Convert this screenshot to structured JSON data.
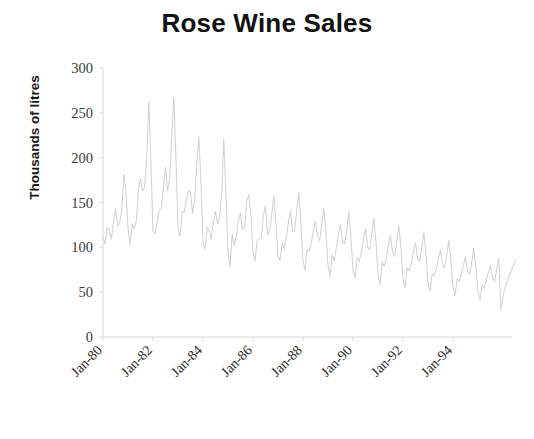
{
  "chart_data": {
    "type": "line",
    "title": "Rose Wine Sales",
    "xlabel": "",
    "ylabel": "Thousands of litres",
    "ylim": [
      0,
      300
    ],
    "y_ticks": [
      0,
      50,
      100,
      150,
      200,
      250,
      300
    ],
    "y_tick_labels": [
      "0",
      "50",
      "100",
      "150",
      "200",
      "250",
      "300"
    ],
    "x_tick_labels": [
      "Jan-80",
      "Jan-82",
      "Jan-84",
      "Jan-86",
      "Jan-88",
      "Jan-90",
      "Jan-92",
      "Jan-94"
    ],
    "x_tick_indices": [
      0,
      24,
      48,
      72,
      96,
      120,
      144,
      168
    ],
    "x_start_label": "Jan-80",
    "x_end_label": "Jul-95",
    "grid": false,
    "legend": "none",
    "series": [
      {
        "name": "Rose Wine Sales",
        "color": "#d2d2d2",
        "units": "thousands of litres",
        "frequency": "monthly",
        "values": [
          112,
          118,
          132,
          129,
          121,
          135,
          148,
          148,
          136,
          119,
          104,
          118,
          115,
          126,
          141,
          135,
          125,
          149,
          170,
          170,
          158,
          133,
          114,
          140,
          145,
          150,
          178,
          163,
          172,
          178,
          199,
          199,
          184,
          162,
          146,
          166,
          171,
          180,
          193,
          181,
          183,
          218,
          230,
          242,
          209,
          191,
          172,
          194,
          196,
          196,
          236,
          235,
          229,
          243,
          264,
          272,
          237,
          211,
          180,
          201,
          204,
          188,
          235,
          227,
          234,
          264,
          302,
          293,
          259,
          229,
          203,
          229,
          242,
          233,
          267,
          269,
          270,
          315,
          364,
          347,
          312,
          274,
          237,
          278,
          284,
          277,
          317,
          313,
          318,
          374,
          413,
          405,
          355,
          306,
          271,
          306,
          315,
          301,
          356,
          348,
          355,
          422,
          465,
          467,
          404,
          347,
          305,
          336,
          340,
          318,
          362,
          348,
          363,
          435,
          491,
          505,
          404,
          359,
          310,
          337,
          360,
          342,
          406,
          396,
          420,
          472,
          548,
          559,
          463,
          407,
          362,
          405,
          417,
          391,
          419,
          461,
          472,
          535,
          622,
          606,
          508,
          461,
          390,
          432
        ]
      }
    ],
    "data_points_monthly": {
      "start": "Jan-1980",
      "end": "Jul-1995",
      "n": 187,
      "values": [
        112,
        118,
        132,
        129,
        121,
        135,
        148,
        148,
        136,
        119,
        104,
        118,
        115,
        126,
        141,
        135,
        125,
        149,
        170,
        170,
        158,
        133,
        114,
        140,
        145,
        150,
        178,
        163,
        172,
        178,
        199,
        199,
        184,
        162,
        146,
        166,
        171,
        180,
        193,
        181,
        183,
        218,
        230,
        242,
        209,
        191,
        172,
        194,
        196,
        196,
        236,
        235,
        229,
        243,
        264,
        272,
        237,
        211,
        180,
        201
      ]
    },
    "series_values": [
      111.2,
      104.1,
      122.0,
      119.0,
      109.2,
      126.7,
      142.6,
      124.0,
      127.7,
      140.5,
      181.5,
      163.8,
      121.1,
      103.0,
      126.1,
      120.8,
      129.4,
      164.6,
      176.2,
      163.0,
      166.8,
      201.1,
      262.9,
      197.2,
      117.8,
      115.2,
      127.8,
      141.0,
      143.9,
      166.7,
      189.4,
      163.1,
      175.7,
      223.8,
      267.7,
      201.4,
      120.1,
      112.3,
      140.0,
      139.0,
      152.8,
      163.1,
      161.6,
      137.8,
      153.0,
      193.1,
      224.0,
      174.0,
      104.0,
      98.0,
      122.0,
      119.0,
      109.0,
      129.0,
      140.0,
      126.0,
      133.0,
      161.0,
      221.0,
      159.0,
      95.0,
      78.0,
      115.0,
      102.0,
      113.0,
      130.0,
      138.0,
      120.0,
      122.0,
      151.0,
      159.0,
      136.0,
      94.0,
      85.0,
      108.0,
      110.0,
      111.0,
      136.0,
      146.0,
      114.0,
      119.0,
      136.0,
      158.0,
      130.0,
      91.0,
      85.0,
      105.0,
      98.0,
      112.0,
      128.0,
      141.0,
      118.0,
      118.0,
      141.0,
      161.0,
      128.0,
      86.0,
      74.0,
      98.0,
      96.0,
      105.0,
      119.0,
      129.0,
      113.0,
      107.0,
      126.0,
      143.0,
      118.0,
      81.0,
      67.0,
      92.0,
      85.0,
      99.0,
      114.0,
      125.0,
      107.0,
      104.0,
      118.0,
      139.0,
      113.0,
      75.0,
      66.0,
      88.0,
      84.0,
      95.0,
      108.0,
      121.0,
      101.0,
      97.0,
      114.0,
      133.0,
      107.0,
      70.0,
      59.0,
      83.0,
      79.0,
      88.0,
      102.0,
      113.0,
      95.0,
      90.0,
      107.0,
      125.0,
      100.0,
      66.0,
      55.0,
      77.0,
      74.0,
      82.0,
      95.0,
      105.0,
      88.0,
      84.0,
      99.0,
      117.0,
      93.0,
      61.0,
      51.0,
      71.0,
      68.0,
      76.0,
      88.0,
      97.0,
      81.0,
      77.0,
      91.0,
      108.0,
      85.0,
      56.0,
      46.0,
      65.0,
      62.0,
      70.0,
      80.0,
      89.0,
      74.0,
      70.0,
      83.0,
      99.0,
      78.0,
      51.0,
      41.0,
      58.0,
      55.0,
      63.0,
      72.0,
      80.0,
      66.0,
      62.0,
      75.0,
      88.0,
      30.0,
      45.0,
      55.0,
      62.0,
      68.0,
      74.0,
      80.0,
      86.0
    ]
  },
  "axes": {
    "y_axis_name": "y-axis",
    "x_axis_name": "x-axis"
  }
}
